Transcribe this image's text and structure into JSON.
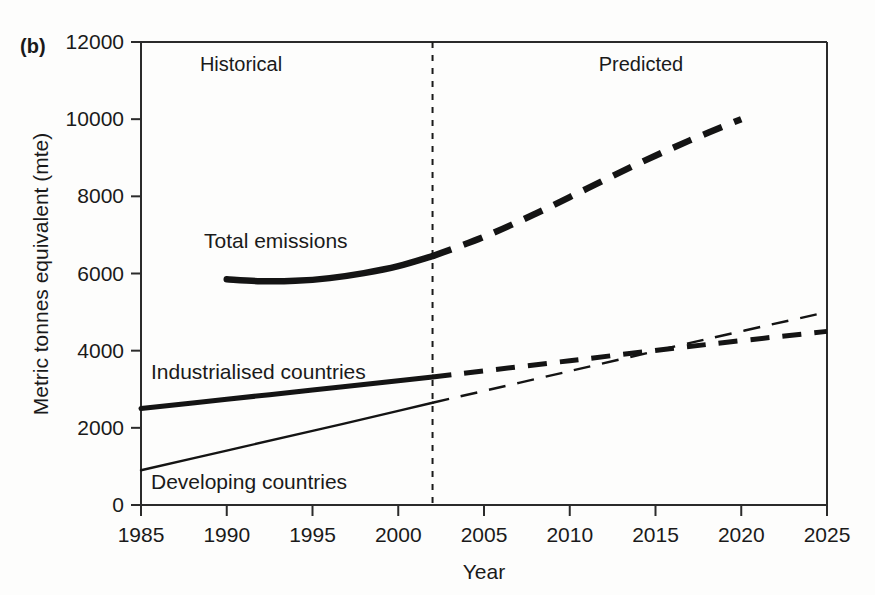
{
  "figure": {
    "panel_label": "(b)"
  },
  "chart_data": {
    "type": "line",
    "title": "",
    "xlabel": "Year",
    "ylabel": "Metric tonnes equivalent (mte)",
    "xlim": [
      1985,
      2025
    ],
    "ylim": [
      0,
      12000
    ],
    "grid": false,
    "legend_position": "inline-labels",
    "x_ticks": [
      1985,
      1990,
      1995,
      2000,
      2005,
      2010,
      2015,
      2020,
      2025
    ],
    "x_tick_labels": [
      "1985",
      "1990",
      "1995",
      "2000",
      "2005",
      "2010",
      "2015",
      "2020",
      "2025"
    ],
    "y_ticks": [
      0,
      2000,
      4000,
      6000,
      8000,
      10000,
      12000
    ],
    "y_tick_labels": [
      "0",
      "2000",
      "4000",
      "6000",
      "8000",
      "10000",
      "12000"
    ],
    "annotations": [
      {
        "text": "Historical",
        "x": 1993,
        "y": 11200
      },
      {
        "text": "Predicted",
        "x": 2014,
        "y": 11200
      }
    ],
    "divider": {
      "x": 2002,
      "style": "dashed-vertical",
      "label_left": "Historical",
      "label_right": "Predicted"
    },
    "series": [
      {
        "name": "Total emissions",
        "style": "thick",
        "label": "Total emissions",
        "label_x": 1993,
        "label_y": 6850,
        "historical": {
          "x": [
            1990,
            1992,
            1994,
            1996,
            1998,
            2000,
            2002
          ],
          "values": [
            5850,
            5800,
            5810,
            5880,
            6010,
            6190,
            6450
          ]
        },
        "predicted": {
          "x": [
            2002,
            2005,
            2008,
            2011,
            2014,
            2017,
            2020
          ],
          "values": [
            6450,
            6950,
            7550,
            8200,
            8850,
            9450,
            10000
          ]
        }
      },
      {
        "name": "Industrialised countries",
        "style": "medium",
        "label": "Industrialised countries",
        "label_x": 1988,
        "label_y": 3600,
        "historical": {
          "x": [
            1985,
            1990,
            1995,
            2000,
            2002
          ],
          "values": [
            2500,
            2740,
            2980,
            3220,
            3320
          ]
        },
        "predicted": {
          "x": [
            2002,
            2010,
            2018,
            2025
          ],
          "values": [
            3320,
            3740,
            4160,
            4500
          ]
        }
      },
      {
        "name": "Developing countries",
        "style": "thin",
        "label": "Developing countries",
        "label_x": 1988,
        "label_y": 700,
        "historical": {
          "x": [
            1985,
            1990,
            1995,
            2000,
            2002
          ],
          "values": [
            900,
            1410,
            1920,
            2440,
            2650
          ]
        },
        "predicted": {
          "x": [
            2002,
            2010,
            2018,
            2025
          ],
          "values": [
            2650,
            3470,
            4300,
            5000
          ]
        }
      }
    ]
  }
}
